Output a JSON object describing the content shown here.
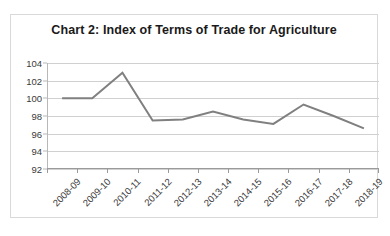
{
  "chart_data": {
    "type": "line",
    "title": "Chart 2: Index of Terms of Trade for Agriculture",
    "xlabel": "",
    "ylabel": "",
    "categories": [
      "2008-09",
      "2009-10",
      "2010-11",
      "2011-12",
      "2012-13",
      "2013-14",
      "2014-15",
      "2015-16",
      "2016-17",
      "2017-18",
      "2018-19"
    ],
    "series": [
      {
        "name": "Index of Terms of Trade for Agriculture",
        "values": [
          100.0,
          100.0,
          102.9,
          97.5,
          97.6,
          98.5,
          97.6,
          97.1,
          99.3,
          98.0,
          96.6
        ],
        "color": "#808080"
      }
    ],
    "ylim": [
      92,
      104
    ],
    "y_ticks": [
      104,
      102,
      100,
      98,
      96,
      94,
      92
    ],
    "y_tick_labels": [
      "104",
      "102",
      "100",
      "98",
      "96",
      "94",
      "92"
    ],
    "grid": true,
    "grid_color": "#d0d0d0",
    "legend": false,
    "legend_position": "none",
    "axis_color": "#9a9a9a",
    "border_color": "#d9d9d9",
    "background": "#ffffff",
    "title_color": "#1a1a1a",
    "tick_label_color": "#3a3a3a",
    "x_tick_rotation": -45
  }
}
